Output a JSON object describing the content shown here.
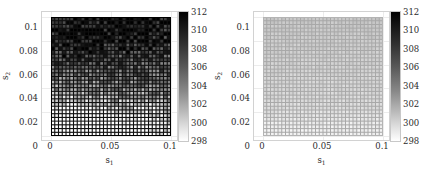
{
  "figure": {
    "background": "#ffffff",
    "panel_count": 2
  },
  "chart_data": [
    {
      "type": "heatmap",
      "panel": "left",
      "title": "",
      "xlabel": "s_1",
      "ylabel": "s_2",
      "xlim": [
        0,
        0.1
      ],
      "ylim": [
        0,
        0.1
      ],
      "xticks": [
        0,
        0.05,
        0.1
      ],
      "xticklabels": [
        "0",
        "0.05",
        "0.1"
      ],
      "yticks": [
        0,
        0.02,
        0.04,
        0.06,
        0.08,
        0.1
      ],
      "yticklabels": [
        "0",
        "0.02",
        "0.04",
        "0.06",
        "0.08",
        "0.1"
      ],
      "grid": true,
      "mesh": {
        "nx": 32,
        "ny": 32,
        "line_color": "#101010",
        "line_visible": true,
        "description": "dense structured quadrilateral mesh with dark element edges and light interiors"
      },
      "colorbar": {
        "vmin": 298,
        "vmax": 312,
        "ticks": [
          298,
          300,
          302,
          304,
          306,
          308,
          310,
          312
        ],
        "ticklabels": [
          "298",
          "300",
          "302",
          "304",
          "306",
          "308",
          "310",
          "312"
        ],
        "colormap": "gray-reversed",
        "high_color": "#000000",
        "low_color": "#ffffff",
        "position": "right"
      },
      "value_range_observed": [
        298,
        312
      ],
      "field_description": "high-contrast field; bright (low ~298-302) patches concentrated near the lower-left and lower-centre, darker (high ~308-312) toward upper region and element edges"
    },
    {
      "type": "heatmap",
      "panel": "right",
      "title": "",
      "xlabel": "s_1",
      "ylabel": "s_2",
      "xlim": [
        0,
        0.1
      ],
      "ylim": [
        0,
        0.1
      ],
      "xticks": [
        0,
        0.05,
        0.1
      ],
      "xticklabels": [
        "0",
        "0.05",
        "0.1"
      ],
      "yticks": [
        0,
        0.02,
        0.04,
        0.06,
        0.08,
        0.1
      ],
      "yticklabels": [
        "0",
        "0.02",
        "0.04",
        "0.06",
        "0.08",
        "0.1"
      ],
      "grid": true,
      "mesh": {
        "nx": 32,
        "ny": 32,
        "line_color": "#a8a8a8",
        "line_visible": true,
        "description": "same structured mesh, rendered in uniform light grey"
      },
      "colorbar": {
        "vmin": 298,
        "vmax": 312,
        "ticks": [
          298,
          300,
          302,
          304,
          306,
          308,
          310,
          312
        ],
        "ticklabels": [
          "298",
          "300",
          "302",
          "304",
          "306",
          "308",
          "310",
          "312"
        ],
        "colormap": "gray-reversed",
        "high_color": "#000000",
        "low_color": "#ffffff",
        "position": "right"
      },
      "value_range_observed": [
        298,
        302
      ],
      "field_description": "nearly uniform low field close to 299-301, fading slightly lighter toward the bottom edge"
    }
  ],
  "panels": [
    {
      "id": "left",
      "xlabel_main": "s",
      "xlabel_sub": "1",
      "ylabel_main": "s",
      "ylabel_sub": "2",
      "xticklabels": [
        "0",
        "0.05",
        "0.1"
      ],
      "yticklabels": [
        "0",
        "0.02",
        "0.04",
        "0.06",
        "0.08",
        "0.1"
      ],
      "cbar_ticklabels": [
        "312",
        "310",
        "308",
        "306",
        "304",
        "302",
        "300",
        "298"
      ]
    },
    {
      "id": "right",
      "xlabel_main": "s",
      "xlabel_sub": "1",
      "ylabel_main": "s",
      "ylabel_sub": "2",
      "xticklabels": [
        "0",
        "0.05",
        "0.1"
      ],
      "yticklabels": [
        "0",
        "0.02",
        "0.04",
        "0.06",
        "0.08",
        "0.1"
      ],
      "cbar_ticklabels": [
        "312",
        "310",
        "308",
        "306",
        "304",
        "302",
        "300",
        "298"
      ]
    }
  ]
}
